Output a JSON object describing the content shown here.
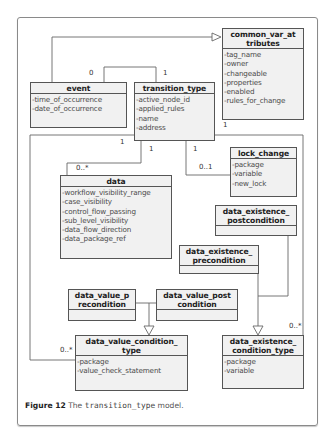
{
  "diagram": {
    "type": "UML class diagram",
    "classes": {
      "event": {
        "name": "event",
        "attributes": [
          "-time_of_occurrence",
          "-date_of_occurrence"
        ]
      },
      "transition_type": {
        "name": "transition_type",
        "attributes": [
          "-active_node_id",
          "-applied_rules",
          "-name",
          "-address"
        ]
      },
      "common_var_attributes": {
        "name_line1": "common_var_at",
        "name_line2": "tributes",
        "attributes": [
          "-tag_name",
          "-owner",
          "-changeable",
          "-properties",
          "-enabled",
          "-rules_for_change"
        ]
      },
      "lock_change": {
        "name": "lock_change",
        "attributes": [
          "-package",
          "-variable",
          "-new_lock"
        ]
      },
      "data": {
        "name": "data",
        "attributes": [
          "-workflow_visibility_range",
          "-case_visibility",
          "-control_flow_passing",
          "-sub_level_visibility",
          "-data_flow_direction",
          "-data_package_ref"
        ]
      },
      "data_existence_postcondition": {
        "name_line1": "data_existence_",
        "name_line2": "postcondition",
        "attributes": []
      },
      "data_existence_precondition": {
        "name_line1": "data_existence_",
        "name_line2": "precondition",
        "attributes": []
      },
      "data_value_precondition": {
        "name_line1": "data_value_p",
        "name_line2": "recondition",
        "attributes": []
      },
      "data_value_postcondition": {
        "name_line1": "data_value_post",
        "name_line2": "condition",
        "attributes": []
      },
      "data_value_condition_type": {
        "name_line1": "data_value_condition_",
        "name_line2": "type",
        "attributes": [
          "-package",
          "-value_check_statement"
        ]
      },
      "data_existence_condition_type": {
        "name_line1": "data_existence_",
        "name_line2": "condition_type",
        "attributes": [
          "-package",
          "-variable"
        ]
      }
    },
    "multiplicities": {
      "event_to_transition_event_end": "0",
      "event_to_transition_transition_end": "1",
      "common_var_bottom": "1",
      "transition_to_dvct": "1",
      "transition_to_data": "1",
      "data_end": "0..*",
      "transition_to_lock": "1",
      "lock_end": "0..1",
      "dvct_end": "0..*",
      "dect_end": "0..*"
    }
  },
  "caption": {
    "label": "Figure 12",
    "text_before": "The",
    "code": "transition_type",
    "text_after": "model."
  }
}
